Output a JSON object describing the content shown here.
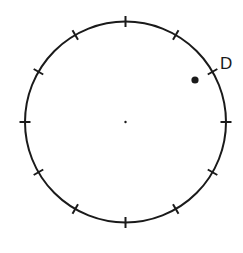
{
  "diagram": {
    "type": "circle-with-ticks",
    "center": {
      "x": 125.5,
      "y": 122
    },
    "radius": 100.5,
    "tick_count": 12,
    "tick_length": 11,
    "stroke_color": "#1a1a1a",
    "point": {
      "label": "D",
      "x": 195,
      "y": 80,
      "r": 3.6
    },
    "label_pos": {
      "x": 220,
      "y": 69
    }
  }
}
